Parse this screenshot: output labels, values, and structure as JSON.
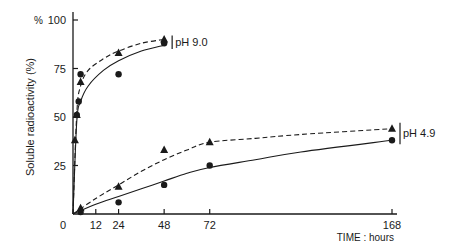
{
  "chart_data": {
    "type": "line",
    "title": "",
    "xlabel": "TIME : hours",
    "ylabel": "Soluble radioactivity (%)",
    "y_unit_label": "%",
    "xlim": [
      0,
      168
    ],
    "ylim": [
      0,
      100
    ],
    "x_ticks": [
      0,
      12,
      24,
      48,
      72,
      168
    ],
    "y_ticks": [
      25,
      50,
      75,
      100
    ],
    "grid": false,
    "annotations": [
      "pH 9.0",
      "pH 4.9"
    ],
    "series": [
      {
        "name": "pH 9.0 triangles (dashed)",
        "group": "pH 9.0",
        "marker": "triangle",
        "line": "dashed",
        "x": [
          1,
          2,
          4,
          24,
          48
        ],
        "y": [
          38,
          51,
          68,
          83,
          90
        ]
      },
      {
        "name": "pH 9.0 circles (solid)",
        "group": "pH 9.0",
        "marker": "circle",
        "line": "solid",
        "x": [
          2,
          3,
          4,
          24,
          48
        ],
        "y": [
          51,
          58,
          72,
          72,
          88
        ]
      },
      {
        "name": "pH 4.9 triangles (dashed)",
        "group": "pH 4.9",
        "marker": "triangle",
        "line": "dashed",
        "x": [
          4,
          24,
          48,
          72,
          168
        ],
        "y": [
          3,
          14,
          33,
          37,
          44
        ]
      },
      {
        "name": "pH 4.9 circles (solid)",
        "group": "pH 4.9",
        "marker": "circle",
        "line": "solid",
        "x": [
          4,
          24,
          48,
          72,
          168
        ],
        "y": [
          1,
          6,
          15,
          25,
          38
        ]
      }
    ],
    "curves": {
      "ph90_dashed": {
        "x": [
          0,
          2,
          4,
          8,
          16,
          24,
          36,
          48
        ],
        "y": [
          0,
          52,
          66,
          74,
          80,
          84,
          88,
          90
        ]
      },
      "ph90_solid": {
        "x": [
          0,
          2,
          4,
          8,
          16,
          24,
          36,
          48
        ],
        "y": [
          0,
          48,
          58,
          66,
          74,
          79,
          84,
          87
        ]
      },
      "ph49_dashed": {
        "x": [
          0,
          12,
          24,
          36,
          48,
          60,
          72,
          96,
          120,
          168
        ],
        "y": [
          0,
          8,
          15,
          22,
          28,
          33,
          37,
          39,
          41,
          44
        ]
      },
      "ph49_solid": {
        "x": [
          0,
          12,
          24,
          36,
          48,
          60,
          72,
          96,
          120,
          168
        ],
        "y": [
          0,
          5,
          9,
          13,
          17,
          21,
          24,
          28,
          32,
          38
        ]
      }
    }
  }
}
